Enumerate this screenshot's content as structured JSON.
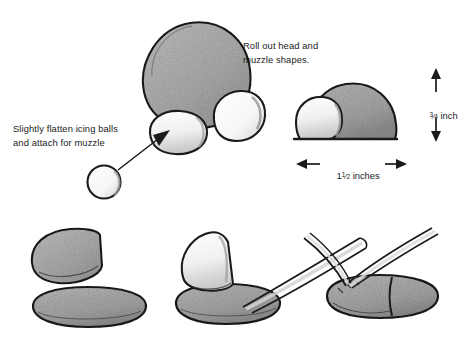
{
  "illustration": {
    "title": "Roll out head and muzzle shapes",
    "medium": "pencil sketch instructional diagram",
    "background_color": "#ffffff",
    "ink_color": "#1b1b1b",
    "gray_fill": "#b0b0b0",
    "light_fill": "#f2f2f2"
  },
  "annotations": {
    "roll_out": {
      "line1": "Roll out head and",
      "line2": "muzzle shapes."
    },
    "flatten": {
      "line1": "Slightly flatten icing balls",
      "line2": "and attach for muzzle"
    }
  },
  "dimensions": {
    "height": {
      "whole": "",
      "numerator": "3",
      "denominator": "4",
      "unit": " inch",
      "label": "3/4 inch",
      "orientation": "vertical"
    },
    "width": {
      "whole": "1",
      "numerator": "1",
      "denominator": "2",
      "unit": " inches",
      "label": "1 1/2 inches",
      "orientation": "horizontal"
    }
  },
  "figures": {
    "head_front": "gray dome head with two light muzzle ovals",
    "icing_ball": "small white icing ball",
    "head_side": "side view gray dome with white muzzle",
    "bottom_left": "gray wedge above flat gray oval base",
    "bottom_middle": "light shape pressed onto gray base with tool",
    "bottom_right": "tweezers pinching gray loaf shape"
  }
}
